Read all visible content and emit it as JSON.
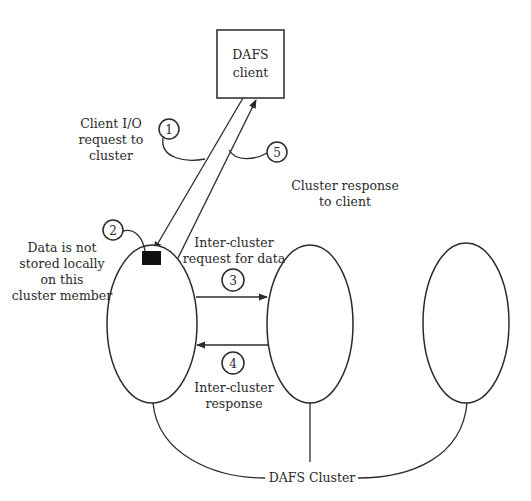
{
  "diagram": {
    "client": {
      "line1": "DAFS",
      "line2": "client"
    },
    "cluster_label": "DAFS Cluster",
    "steps": [
      {
        "number": "1",
        "label_lines": [
          "Client I/O",
          "request to",
          "cluster"
        ]
      },
      {
        "number": "2",
        "label_lines": [
          "Data is not",
          "stored locally",
          "on this",
          "cluster member"
        ]
      },
      {
        "number": "3",
        "label_lines": [
          "Inter-cluster",
          "request for data"
        ]
      },
      {
        "number": "4",
        "label_lines": [
          "Inter-cluster",
          "response"
        ]
      },
      {
        "number": "5",
        "label_lines": [
          "Cluster response",
          "to client"
        ]
      }
    ],
    "nodes": [
      {
        "name": "cluster-member-1"
      },
      {
        "name": "cluster-member-2"
      },
      {
        "name": "cluster-member-3"
      }
    ],
    "colors": {
      "line": "#2a2a2a",
      "data_block": "#111111",
      "background": "#ffffff"
    }
  }
}
